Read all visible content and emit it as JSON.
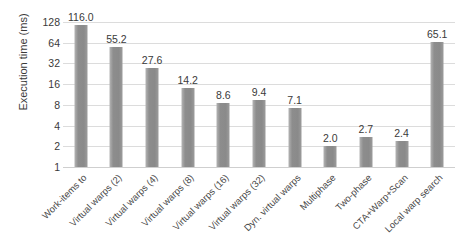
{
  "chart_data": {
    "type": "bar",
    "title": "",
    "subtitle": "",
    "xlabel": "",
    "ylabel": "Execution time (ms)",
    "yscale": "log2",
    "ylim": [
      1,
      128
    ],
    "ytick_labels": [
      "128",
      "64",
      "32",
      "16",
      "8",
      "4",
      "2",
      "1"
    ],
    "ytick_values": [
      128,
      64,
      32,
      16,
      8,
      4,
      2,
      1
    ],
    "grid": true,
    "legend": "none",
    "bar_color": "#8d8d8d",
    "gridline_color": "#dcdcdc",
    "text_color": "#3a3a3a",
    "categories": [
      "Work-items to",
      "Virtual warps (2)",
      "Virtual warps (4)",
      "Virtual warps (8)",
      "Virtual warps (16)",
      "Virtual warps (32)",
      "Dyn. virtual warps",
      "Multiphase",
      "Two-phase",
      "CTA+Warp+Scan",
      "Local warp search"
    ],
    "values": [
      116.0,
      55.2,
      27.6,
      14.2,
      8.6,
      9.4,
      7.1,
      2.0,
      2.7,
      2.4,
      65.1
    ],
    "value_labels": [
      "116.0",
      "55.2",
      "27.6",
      "14.2",
      "8.6",
      "9.4",
      "7.1",
      "2.0",
      "2.7",
      "2.4",
      "65.1"
    ]
  }
}
